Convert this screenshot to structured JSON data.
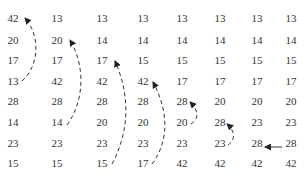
{
  "diagram": {
    "type": "insertion-sort-trace",
    "columns": [
      {
        "step": 0,
        "values": [
          "42",
          "20",
          "17",
          "13",
          "28",
          "14",
          "23",
          "15"
        ]
      },
      {
        "step": 1,
        "values": [
          "13",
          "20",
          "17",
          "42",
          "28",
          "14",
          "23",
          "15"
        ]
      },
      {
        "step": 2,
        "values": [
          "13",
          "14",
          "17",
          "42",
          "28",
          "20",
          "23",
          "15"
        ]
      },
      {
        "step": 3,
        "values": [
          "13",
          "14",
          "15",
          "42",
          "28",
          "20",
          "23",
          "17"
        ]
      },
      {
        "step": 4,
        "values": [
          "13",
          "14",
          "15",
          "17",
          "28",
          "20",
          "23",
          "42"
        ]
      },
      {
        "step": 5,
        "values": [
          "13",
          "14",
          "15",
          "17",
          "20",
          "28",
          "23",
          "42"
        ]
      },
      {
        "step": 6,
        "values": [
          "13",
          "14",
          "15",
          "17",
          "20",
          "23",
          "28",
          "42"
        ]
      },
      {
        "step": 7,
        "values": [
          "13",
          "14",
          "15",
          "17",
          "20",
          "23",
          "28",
          "42"
        ]
      }
    ],
    "arrows": [
      {
        "column": 0,
        "from_row": 3,
        "to_row": 0,
        "style": "dashed-curve"
      },
      {
        "column": 1,
        "from_row": 5,
        "to_row": 1,
        "style": "dashed-curve"
      },
      {
        "column": 2,
        "from_row": 7,
        "to_row": 2,
        "style": "dashed-curve"
      },
      {
        "column": 3,
        "from_row": 7,
        "to_row": 3,
        "style": "dashed-curve"
      },
      {
        "column": 4,
        "from_row": 5,
        "to_row": 4,
        "style": "dashed-curve"
      },
      {
        "column": 5,
        "from_row": 6,
        "to_row": 5,
        "style": "dashed-curve"
      },
      {
        "column": 6,
        "from_col": 7,
        "row": 6,
        "style": "solid-horizontal"
      }
    ]
  }
}
